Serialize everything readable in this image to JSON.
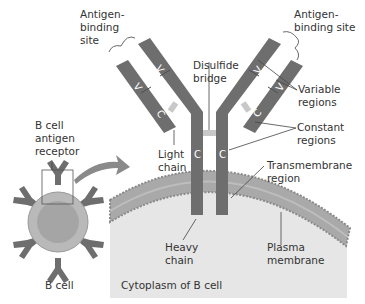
{
  "diagram": {
    "colors": {
      "chain": "#6e6e6e",
      "chain_divider": "#4f4f4f",
      "disulfide": "#c8c8c8",
      "membrane": "#a9a9a9",
      "membrane_heads": "#8a8a8a",
      "cytoplasm": "#e6e6e6",
      "cell_body": "#b9b9b9",
      "label_text": "#333333",
      "leader_line": "#444444"
    },
    "labels": {
      "antigen_binding_left": [
        "Antigen-",
        "binding",
        "site"
      ],
      "antigen_binding_right": [
        "Antigen-",
        "binding site"
      ],
      "disulfide_bridge": [
        "Disulfide",
        "bridge"
      ],
      "variable_regions": [
        "Variable",
        "regions"
      ],
      "constant_regions": [
        "Constant",
        "regions"
      ],
      "b_cell_antigen_receptor": [
        "B cell",
        "antigen",
        "receptor"
      ],
      "light_chain": [
        "Light",
        "chain"
      ],
      "transmembrane_region": [
        "Transmembrane",
        "region"
      ],
      "heavy_chain": [
        "Heavy",
        "chain"
      ],
      "plasma_membrane": [
        "Plasma",
        "membrane"
      ],
      "cytoplasm": "Cytoplasm of B cell",
      "b_cell": "B cell"
    },
    "segment_letters": {
      "variable": "V",
      "constant": "C"
    }
  }
}
